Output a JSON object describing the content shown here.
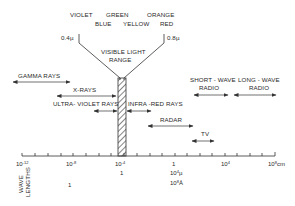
{
  "figure": {
    "visible_colors_top": [
      "VIOLET",
      "GREEN",
      "ORANGE"
    ],
    "visible_colors_bottom": [
      "BLUE",
      "YELLOW",
      "RED"
    ],
    "visible_start": "0.4µ",
    "visible_end": "0.8µ",
    "visible_range_label_1": "VISIBLE LIGHT",
    "visible_range_label_2": "RANGE",
    "bands": {
      "gamma": "GAMMA RAYS",
      "xray": "X-RAYS",
      "uv": "ULTRA- VIOLET RAYS",
      "ir": "INFRA -RED RAYS",
      "radar": "RADAR",
      "tv": "TV",
      "short_wave_1": "SHORT - WAVE",
      "short_wave_2": "RADIO",
      "long_wave_1": "LONG - WAVE",
      "long_wave_2": "RADIO"
    },
    "axis": {
      "ticks": [
        {
          "base": "10",
          "exp": "-12",
          "suffix": ""
        },
        {
          "base": "10",
          "exp": "-8",
          "suffix": ""
        },
        {
          "base": "10",
          "exp": "-4",
          "suffix": ""
        },
        {
          "base": "1",
          "exp": "",
          "suffix": ""
        },
        {
          "base": "10",
          "exp": "4",
          "suffix": ""
        },
        {
          "base": "10",
          "exp": "8",
          "suffix": "cm"
        }
      ],
      "side_label_1": "WAVE",
      "side_label_2": "LENGTHS",
      "row2_under_1e-4": "1",
      "row2_under_1": "10",
      "row2_under_1_exp": "4",
      "row2_under_1_unit": "µ",
      "row3_under_1": "10",
      "row3_under_1_exp": "8",
      "row3_under_1_unit": "Å",
      "row2_left": "1"
    }
  }
}
